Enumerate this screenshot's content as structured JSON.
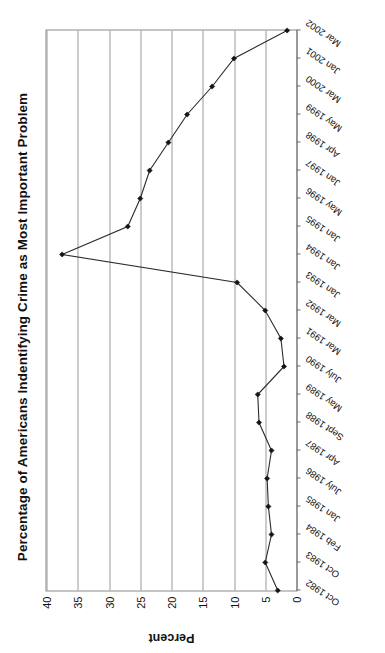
{
  "chart_data": {
    "type": "line",
    "title": "Percentage of Americans Indentifying Crime as Most Important Problem",
    "xlabel": "",
    "ylabel": "Percent",
    "ylim": [
      0,
      40
    ],
    "yticks": [
      0,
      5,
      10,
      15,
      20,
      25,
      30,
      35,
      40
    ],
    "ytick_labels": [
      "0",
      "5",
      "10",
      "15",
      "20",
      "25",
      "30",
      "35",
      "40"
    ],
    "grid": true,
    "legend": null,
    "categories": [
      "Oct 1982",
      "Oct 1983",
      "Feb 1984",
      "Jan 1985",
      "July 1986",
      "Apr 1987",
      "Sept 1988",
      "May 1989",
      "July 1990",
      "Mar 1991",
      "Mar 1992",
      "Jan 1993",
      "Jan 1994",
      "Jan 1995",
      "May 1996",
      "Jan 1997",
      "Apr 1998",
      "May 1999",
      "Mar 2000",
      "Jan 2001",
      "Mar 2002"
    ],
    "values": [
      3,
      5,
      4,
      4.5,
      4.7,
      4,
      6,
      6.2,
      2,
      2.5,
      5,
      9.5,
      37.5,
      27,
      25,
      23.5,
      20.5,
      17.5,
      13.5,
      10,
      1.5
    ],
    "series": [
      {
        "name": "Crime as Most Important Problem",
        "values": [
          3,
          5,
          4,
          4.5,
          4.7,
          4,
          6,
          6.2,
          2,
          2.5,
          5,
          9.5,
          37.5,
          27,
          25,
          23.5,
          20.5,
          17.5,
          13.5,
          10,
          1.5
        ]
      }
    ],
    "marker": "filled-diamond",
    "line_color": "#2b2b2b",
    "marker_color": "#151515",
    "grid_color": "#9a9a9a",
    "axis_color": "#6e6e6e"
  }
}
